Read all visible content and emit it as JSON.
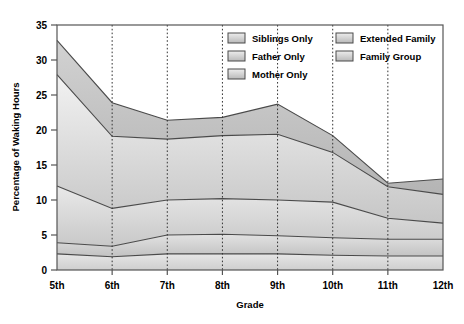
{
  "chart_data": {
    "type": "area",
    "title": "",
    "xlabel": "Grade",
    "ylabel": "Percentage of Waking Hours",
    "categories": [
      "5th",
      "6th",
      "7th",
      "8th",
      "9th",
      "10th",
      "11th",
      "12th"
    ],
    "ylim": [
      0,
      35
    ],
    "yticks": [
      0,
      5,
      10,
      15,
      20,
      25,
      30,
      35
    ],
    "grid": "vertical-dotted",
    "stacked": true,
    "legend_position": "top-center-inside",
    "series": [
      {
        "name": "Mother Only",
        "values": [
          2.3,
          1.9,
          2.3,
          2.3,
          2.3,
          2.1,
          2.0,
          2.0
        ]
      },
      {
        "name": "Father Only",
        "values": [
          1.6,
          1.5,
          2.7,
          2.8,
          2.6,
          2.5,
          2.4,
          2.4
        ]
      },
      {
        "name": "Siblings Only",
        "values": [
          8.1,
          5.4,
          5.0,
          5.1,
          5.1,
          5.1,
          3.0,
          2.3
        ]
      },
      {
        "name": "Extended Family",
        "values": [
          15.9,
          10.3,
          8.7,
          9.0,
          9.4,
          7.1,
          4.5,
          4.1
        ]
      },
      {
        "name": "Family Group",
        "values": [
          4.9,
          4.8,
          2.7,
          2.6,
          4.3,
          2.4,
          0.5,
          2.2
        ]
      }
    ],
    "series_totals": [
      32.8,
      23.9,
      21.4,
      21.8,
      23.7,
      19.2,
      12.4,
      13.0
    ],
    "colors": {
      "mother_only": "#d9d9d9",
      "father_only": "#c4c4c4",
      "siblings_only": "#d0d0d0",
      "extended_family": "#cfcfcf",
      "family_group": "#b8b8b8",
      "outline": "#4a4a4a",
      "frame": "#555555",
      "gridline": "#333333",
      "plot_background": "#ffffff"
    }
  },
  "legend": {
    "items": [
      {
        "label": "Siblings Only"
      },
      {
        "label": "Extended Family"
      },
      {
        "label": "Father Only"
      },
      {
        "label": "Family Group"
      },
      {
        "label": "Mother Only"
      }
    ]
  },
  "axes": {
    "y_title": "Percentage of Waking Hours",
    "x_title": "Grade",
    "y_ticks": [
      "0",
      "5",
      "10",
      "15",
      "20",
      "25",
      "30",
      "35"
    ],
    "x_ticks": [
      "5th",
      "6th",
      "7th",
      "8th",
      "9th",
      "10th",
      "11th",
      "12th"
    ]
  }
}
